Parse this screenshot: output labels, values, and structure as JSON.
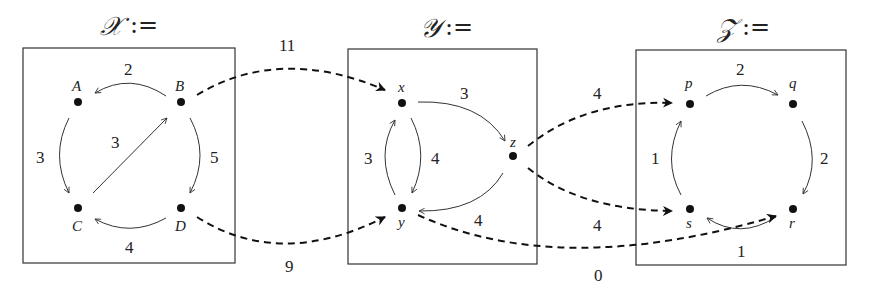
{
  "categories": {
    "X": {
      "title": "𝒳",
      "assign": ":=",
      "nodes": {
        "A": "A",
        "B": "B",
        "C": "C",
        "D": "D"
      },
      "edges": [
        {
          "from": "B",
          "to": "A",
          "weight": "2"
        },
        {
          "from": "A",
          "to": "C",
          "weight": "3"
        },
        {
          "from": "C",
          "to": "B",
          "weight": "3"
        },
        {
          "from": "B",
          "to": "D",
          "weight": "5"
        },
        {
          "from": "D",
          "to": "C",
          "weight": "4"
        }
      ]
    },
    "Y": {
      "title": "𝒴",
      "assign": ":=",
      "nodes": {
        "x": "x",
        "y": "y",
        "z": "z"
      },
      "edges": [
        {
          "from": "x",
          "to": "z",
          "weight": "3"
        },
        {
          "from": "y",
          "to": "x",
          "weight": "3"
        },
        {
          "from": "x",
          "to": "y",
          "weight": "4"
        },
        {
          "from": "z",
          "to": "y",
          "weight": "4"
        }
      ]
    },
    "Z": {
      "title": "𝒵",
      "assign": ":=",
      "nodes": {
        "p": "p",
        "q": "q",
        "r": "r",
        "s": "s"
      },
      "edges": [
        {
          "from": "p",
          "to": "q",
          "weight": "2"
        },
        {
          "from": "q",
          "to": "r",
          "weight": "2"
        },
        {
          "from": "r",
          "to": "s",
          "weight": "1"
        },
        {
          "from": "s",
          "to": "p",
          "weight": "1"
        }
      ]
    }
  },
  "functors": [
    {
      "from": "B",
      "to": "x",
      "weight": "11"
    },
    {
      "from": "D",
      "to": "y",
      "weight": "9"
    },
    {
      "from": "z",
      "to": "p",
      "weight": "4"
    },
    {
      "from": "z",
      "to": "s",
      "weight": "4"
    },
    {
      "from": "y",
      "to": "r",
      "weight": "0"
    }
  ]
}
